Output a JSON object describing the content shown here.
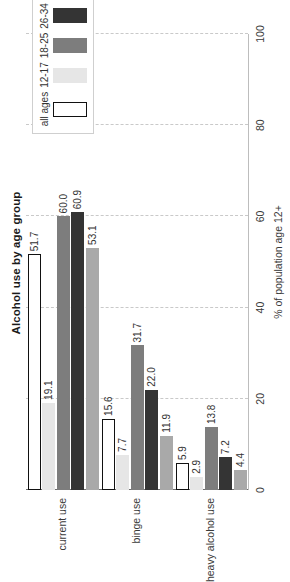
{
  "chart_data": {
    "type": "bar",
    "title": "Alcohol use by age group",
    "orientation": "vertical",
    "xlabel": "",
    "ylabel": "% of population age 12+",
    "ylim": [
      0,
      100
    ],
    "yticks": [
      0,
      20,
      40,
      60,
      80,
      100
    ],
    "grid": true,
    "legend_position": "top-right",
    "categories": [
      "current use",
      "binge use",
      "heavy alcohol use"
    ],
    "series": [
      {
        "name": "all ages",
        "color": "#ffffff",
        "edgecolor": "#111111",
        "values": [
          51.7,
          15.6,
          5.9
        ]
      },
      {
        "name": "12-17",
        "color": "#e6e6e6",
        "edgecolor": "#e6e6e6",
        "values": [
          19.1,
          7.7,
          2.9
        ]
      },
      {
        "name": "18-25",
        "color": "#7d7d7d",
        "edgecolor": "#7d7d7d",
        "values": [
          60.0,
          31.7,
          13.8
        ]
      },
      {
        "name": "26-34",
        "color": "#343434",
        "edgecolor": "#343434",
        "values": [
          60.9,
          22.0,
          7.2
        ]
      },
      {
        "name": "35+",
        "color": "#a9a9a9",
        "edgecolor": "#a9a9a9",
        "values": [
          53.1,
          11.9,
          4.4
        ]
      }
    ],
    "data_labels": [
      [
        "51.7",
        "19.1",
        "60.0",
        "60.9",
        "53.1"
      ],
      [
        "15.6",
        "7.7",
        "31.7",
        "22.0",
        "11.9"
      ],
      [
        "5.9",
        "2.9",
        "13.8",
        "7.2",
        "4.4"
      ]
    ]
  },
  "axis": {
    "tick_labels": [
      "0",
      "20",
      "40",
      "60",
      "80",
      "100"
    ],
    "y_axis_title": "% of population age 12+"
  },
  "legend": {
    "items": [
      {
        "label": "all ages"
      },
      {
        "label": "12-17"
      },
      {
        "label": "18-25"
      },
      {
        "label": "26-34"
      },
      {
        "label": "35+"
      }
    ]
  },
  "title": {
    "text": "Alcohol use by age group"
  }
}
